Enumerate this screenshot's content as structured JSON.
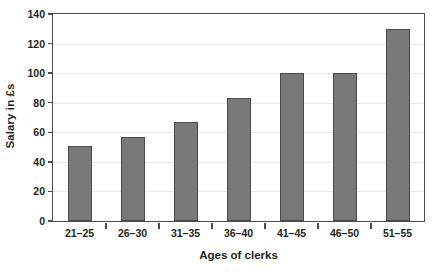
{
  "chart_data": {
    "type": "bar",
    "title": "",
    "subtitle": "",
    "xlabel": "Ages of clerks",
    "ylabel": "Salary in £s",
    "categories": [
      "21–25",
      "26–30",
      "31–35",
      "36–40",
      "41–45",
      "46–50",
      "51–55"
    ],
    "values": [
      51,
      57,
      67,
      83,
      100,
      100,
      130
    ],
    "ylim": [
      0,
      140
    ],
    "yticks": [
      0,
      20,
      40,
      60,
      80,
      100,
      120,
      140
    ],
    "ytick_labels": [
      "0",
      "20",
      "40",
      "60",
      "80",
      "100",
      "120",
      "140"
    ],
    "grid": true,
    "grid_axis": "y",
    "legend": null,
    "legend_position": "none",
    "annotations": [],
    "series": [
      {
        "name": "Salary",
        "values": [
          51,
          57,
          67,
          83,
          100,
          100,
          130
        ]
      }
    ]
  },
  "style": {
    "bar_fill": "#78787b",
    "bar_edge": "#4b4b4d",
    "axis_color": "#4b4b4d",
    "grid_color": "#e9e9ea",
    "background": "#ffffff",
    "text_color": "#231f20"
  }
}
